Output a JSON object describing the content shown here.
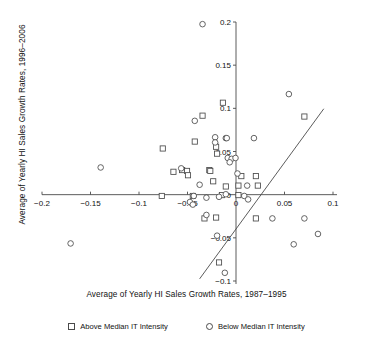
{
  "chart_data": {
    "type": "scatter",
    "title": "",
    "xlabel": "Average of Yearly HI Sales Growth Rates, 1987–1995",
    "ylabel": "Average of Yearly HI Sales Growth Rates, 1996–2006",
    "xlim": [
      -0.2,
      0.1
    ],
    "ylim": [
      -0.1,
      0.2
    ],
    "xticks": [
      -0.2,
      -0.15,
      -0.1,
      -0.05,
      0,
      0.05,
      0.1
    ],
    "xticklabels": [
      "−0.2",
      "−0.15",
      "−0.1",
      "−0.05",
      "0",
      "0.05",
      "0.1"
    ],
    "yticks": [
      -0.1,
      -0.05,
      0,
      0.05,
      0.1,
      0.15,
      0.2
    ],
    "yticklabels": [
      "−0.1",
      "−0.05",
      "0",
      "0.05",
      "0.1",
      "0.15",
      "0.2"
    ],
    "grid": false,
    "legend_position": "bottom",
    "axes_style": "crossed-at-origin",
    "marker_color": "#4a4a4a",
    "line_color": "#4a4a4a",
    "series": [
      {
        "name": "Above Median IT Intensity",
        "marker": "square",
        "points": [
          [
            -0.0755,
            0.0535
          ],
          [
            -0.0425,
            0.0615
          ],
          [
            -0.0345,
            0.0915
          ],
          [
            -0.0555,
            0.0285
          ],
          [
            -0.0505,
            0.0275
          ],
          [
            -0.0495,
            0.0225
          ],
          [
            -0.0275,
            0.0285
          ],
          [
            -0.0265,
            0.0275
          ],
          [
            -0.0205,
            0.0555
          ],
          [
            -0.0195,
            0.0475
          ],
          [
            -0.0135,
            0.1065
          ],
          [
            -0.0235,
            0.0155
          ],
          [
            -0.0105,
            0.0095
          ],
          [
            -0.0145,
            -0.0005
          ],
          [
            -0.0445,
            -0.0015
          ],
          [
            -0.0765,
            -0.0015
          ],
          [
            -0.0325,
            -0.0275
          ],
          [
            -0.0205,
            -0.0265
          ],
          [
            -0.0175,
            -0.0785
          ],
          [
            0.0025,
            -0.0005
          ],
          [
            0.0025,
            0.0105
          ],
          [
            0.0055,
            0.0215
          ],
          [
            0.0205,
            0.0215
          ],
          [
            0.0225,
            0.0105
          ],
          [
            0.0205,
            -0.0275
          ],
          [
            0.0705,
            0.0905
          ],
          [
            -0.0645,
            0.0265
          ]
        ]
      },
      {
        "name": "Below Median IT Intensity",
        "marker": "circle",
        "points": [
          [
            -0.0345,
            0.1975
          ],
          [
            -0.0425,
            0.0855
          ],
          [
            -0.1395,
            0.0315
          ],
          [
            -0.0215,
            0.0665
          ],
          [
            -0.0105,
            0.0655
          ],
          [
            -0.0095,
            0.0655
          ],
          [
            -0.0215,
            0.0605
          ],
          [
            -0.0565,
            0.0305
          ],
          [
            -0.0085,
            0.0425
          ],
          [
            -0.0045,
            0.0415
          ],
          [
            -0.0005,
            0.0425
          ],
          [
            -0.0065,
            0.0375
          ],
          [
            0.0015,
            0.0245
          ],
          [
            -0.0375,
            0.0115
          ],
          [
            -0.0435,
            -0.0015
          ],
          [
            -0.0305,
            -0.0035
          ],
          [
            -0.0175,
            -0.0025
          ],
          [
            -0.0105,
            0.0005
          ],
          [
            -0.0475,
            -0.0085
          ],
          [
            -0.0445,
            -0.0115
          ],
          [
            0.0085,
            -0.0015
          ],
          [
            0.0115,
            0.0105
          ],
          [
            0.0185,
            0.0655
          ],
          [
            -0.0305,
            -0.0235
          ],
          [
            -0.0195,
            -0.0475
          ],
          [
            -0.0115,
            -0.0905
          ],
          [
            0.0125,
            -0.0055
          ],
          [
            0.0545,
            0.1165
          ],
          [
            0.0705,
            -0.0275
          ],
          [
            0.0845,
            -0.0455
          ],
          [
            0.0595,
            -0.0575
          ],
          [
            0.0375,
            -0.0275
          ],
          [
            -0.1705,
            -0.0565
          ]
        ]
      }
    ],
    "fit_line": {
      "name": "regression-line",
      "x_start": -0.0375,
      "y_start": -0.0975,
      "x_end": 0.0905,
      "y_end": 0.0995
    }
  },
  "legend": {
    "items": [
      {
        "marker": "square",
        "label": "Above Median IT Intensity"
      },
      {
        "marker": "circle",
        "label": "Below Median IT Intensity"
      }
    ]
  }
}
